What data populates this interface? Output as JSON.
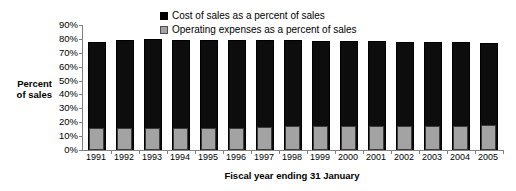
{
  "chart_data": {
    "type": "bar",
    "title": "",
    "subtitle": "",
    "xlabel": "Fiscal year ending 31 January",
    "ylabel": "Percent of sales",
    "ylabel_lines": [
      "Percent",
      "of sales"
    ],
    "categories": [
      "1991",
      "1992",
      "1993",
      "1994",
      "1995",
      "1996",
      "1997",
      "1998",
      "1999",
      "2000",
      "2001",
      "2002",
      "2003",
      "2004",
      "2005"
    ],
    "series": [
      {
        "name": "Cost of sales as a percent of sales",
        "color": "#0d0d0d",
        "values": [
          78,
          79,
          80,
          79.5,
          79.5,
          79.5,
          79,
          79,
          78.5,
          78.5,
          78.5,
          78,
          78,
          78,
          77
        ]
      },
      {
        "name": "Operating expenses as a percent of sales",
        "color": "#a3a3a3",
        "values": [
          15.5,
          15.5,
          15.5,
          15.5,
          15.5,
          16,
          16.5,
          17,
          17,
          17.5,
          17.5,
          17.5,
          17.5,
          17.5,
          18
        ]
      }
    ],
    "ylim": [
      0,
      90
    ],
    "ytick_step": 10,
    "yticks": [
      "90%",
      "80%",
      "70%",
      "60%",
      "50%",
      "40%",
      "30%",
      "20%",
      "10%",
      "0%"
    ],
    "ytick_values": [
      90,
      80,
      70,
      60,
      50,
      40,
      30,
      20,
      10,
      0
    ],
    "grid": false,
    "legend_position": "top-center",
    "bar_overlap": true
  }
}
